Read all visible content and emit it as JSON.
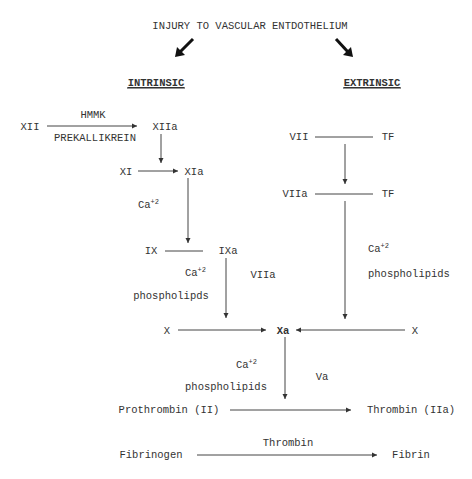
{
  "title": "INJURY TO VASCULAR ENTDOTHELIUM",
  "pathways": {
    "intrinsic": {
      "heading": "INTRINSIC",
      "xii": "XII",
      "hmmk": "HMMK",
      "prekallikrein": "PREKALLIKREIN",
      "xiia": "XIIa",
      "xi": "XI",
      "xia": "XIa",
      "ca1": "Ca",
      "ca1_sup": "+2",
      "ix": "IX",
      "ixa": "IXa",
      "ca2": "Ca",
      "ca2_sup": "+2",
      "phospholipids": "phospholipds",
      "viia_cofactor": "VIIa"
    },
    "extrinsic": {
      "heading": "EXTRINSIC",
      "vii": "VII",
      "tf1": "TF",
      "viia": "VIIa",
      "tf2": "TF",
      "ca": "Ca",
      "ca_sup": "+2",
      "phospholipids": "phospholipids"
    }
  },
  "common": {
    "x_left": "X",
    "xa": "Xa",
    "x_right": "X",
    "ca": "Ca",
    "ca_sup": "+2",
    "phospholipids": "phospholipids",
    "va": "Va",
    "prothrombin": "Prothrombin (II)",
    "thrombin_iia": "Thrombin (IIa)",
    "thrombin_label": "Thrombin",
    "fibrinogen": "Fibrinogen",
    "fibrin": "Fibrin"
  }
}
